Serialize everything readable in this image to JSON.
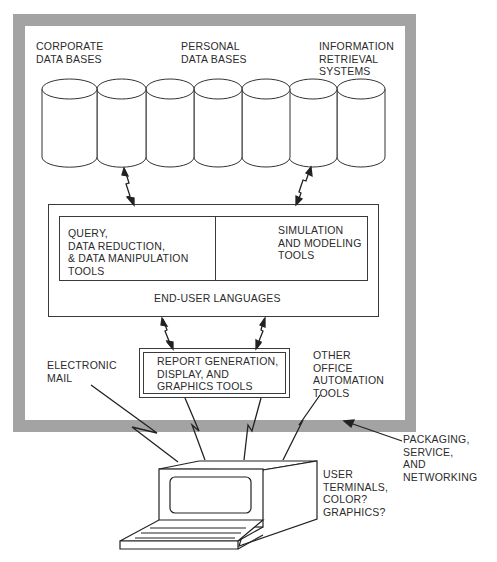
{
  "diagram": {
    "frame": {
      "color": "#a3a3a3",
      "label": "PACKAGING,\nSERVICE,\nAND\nNETWORKING"
    },
    "databases": {
      "count": 7,
      "labels": {
        "corporate": "CORPORATE\nDATA BASES",
        "personal": "PERSONAL\nDATA BASES",
        "information": "INFORMATION\nRETRIEVAL\nSYSTEMS"
      }
    },
    "end_user_languages": {
      "label": "END-USER LANGUAGES",
      "left_tools": "QUERY,\nDATA REDUCTION,\n& DATA MANIPULATION\nTOOLS",
      "right_tools": "SIMULATION\nAND MODELING\nTOOLS"
    },
    "report_tools": {
      "label": "REPORT GENERATION,\nDISPLAY, AND\nGRAPHICS TOOLS"
    },
    "electronic_mail": {
      "label": "ELECTRONIC\nMAIL"
    },
    "office_automation": {
      "label": "OTHER\nOFFICE\nAUTOMATION\nTOOLS"
    },
    "terminal": {
      "label": "USER\nTERMINALS,\nCOLOR?\nGRAPHICS?"
    }
  }
}
